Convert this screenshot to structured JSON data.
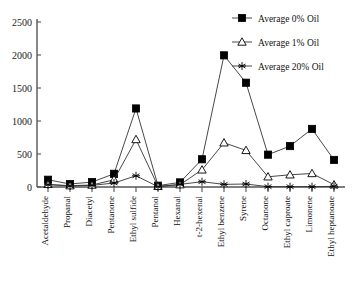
{
  "chart_data": {
    "type": "line",
    "title": "",
    "xlabel": "",
    "ylabel": "",
    "ylim": [
      0,
      2500
    ],
    "yticks": [
      0,
      500,
      1000,
      1500,
      2000,
      2500
    ],
    "ytick_labels": [
      "0",
      "500",
      "1000",
      "1500",
      "2000",
      "2500"
    ],
    "grid": false,
    "legend_position": "top-right",
    "categories": [
      "Acetaldehyde",
      "Propanal",
      "Diacetyl",
      "Pentanone",
      "Ethyl sulfide",
      "Pentanol",
      "Hexanal",
      "t-2-hexenal",
      "Ethyl benzene",
      "Syrene",
      "Octanone",
      "Ethyl caproate",
      "Limonene",
      "Ethyl heptanoate"
    ],
    "series": [
      {
        "name": "Average 0% Oil",
        "marker": "filled-square",
        "values": [
          110,
          45,
          75,
          200,
          1190,
          20,
          70,
          420,
          1995,
          1580,
          490,
          620,
          880,
          410
        ]
      },
      {
        "name": "Average 1% Oil",
        "marker": "open-triangle",
        "values": [
          40,
          20,
          30,
          110,
          720,
          10,
          35,
          260,
          670,
          555,
          155,
          185,
          205,
          35
        ]
      },
      {
        "name": "Average 20% Oil",
        "marker": "asterisk",
        "values": [
          35,
          15,
          25,
          60,
          170,
          5,
          40,
          80,
          40,
          45,
          5,
          5,
          5,
          10
        ]
      }
    ]
  },
  "legend": {
    "entries": [
      {
        "label": "Average 0% Oil",
        "marker": "filled-square"
      },
      {
        "label": "Average 1% Oil",
        "marker": "open-triangle"
      },
      {
        "label": "Average 20% Oil",
        "marker": "asterisk"
      }
    ]
  },
  "colors": {
    "line": "#333333",
    "axis": "#555555",
    "text": "#111111",
    "background": "#ffffff"
  }
}
